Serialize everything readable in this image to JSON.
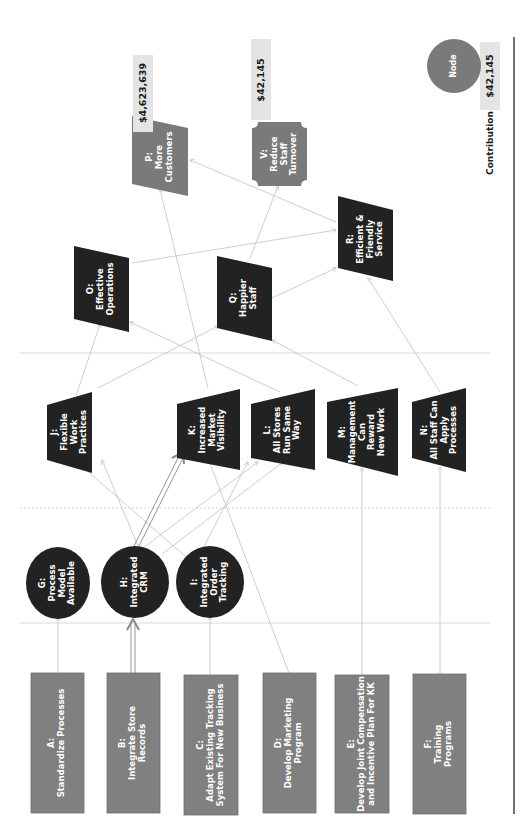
{
  "diagram": {
    "orientation": "rotated-90-ccw",
    "colors": {
      "input_box": "#808080",
      "intermediate": "#222222",
      "outcome": "#7a7a7a",
      "value_tag": "#e4e4e4",
      "connector": "#c8c8c8",
      "highlight_connector": "#8a8a8a",
      "legend_node": "#7a7a7a",
      "frame_line": "#222222"
    },
    "inputs": [
      {
        "id": "A",
        "label": "A:\nStandardize Processes"
      },
      {
        "id": "B",
        "label": "B:\nIntegrate Store\nRecords"
      },
      {
        "id": "C",
        "label": "C:\nAdapt Existing Tracking\nSystem For New Business"
      },
      {
        "id": "D",
        "label": "D:\nDevelop Marketing\nProgram"
      },
      {
        "id": "E",
        "label": "E:\nDevelop Joint Compensation\nand Incentive Plan For KK"
      },
      {
        "id": "F",
        "label": "F:\nTraining Programs"
      }
    ],
    "capabilities": [
      {
        "id": "G",
        "label": "G:\nProcess\nModel\nAvailable"
      },
      {
        "id": "H",
        "label": "H:\nIntegrated\nCRM"
      },
      {
        "id": "I",
        "label": "I:\nIntegrated\nOrder\nTracking"
      }
    ],
    "intermediate_outcomes": [
      {
        "id": "J",
        "label": "J:\nFlexible\nWork\nPractices"
      },
      {
        "id": "K",
        "label": "K:\nIncreased\nMarket\nVisibility"
      },
      {
        "id": "L",
        "label": "L:\nAll Stores\nRun Same\nWay"
      },
      {
        "id": "M",
        "label": "M:\nManagement\nCan\nReward\nNew Work"
      },
      {
        "id": "N",
        "label": "N:\nAll Staff Can\nApply\nProcesses"
      }
    ],
    "business_outcomes": [
      {
        "id": "O",
        "label": "O:\nEffective\nOperations"
      },
      {
        "id": "Q",
        "label": "Q:\nHappier\nStaff"
      },
      {
        "id": "R",
        "label": "R:\nEfficient &\nFriendly\nService"
      }
    ],
    "end_benefits": [
      {
        "id": "P",
        "label": "P:\nMore\nCustomers",
        "contribution": "$4,623,639"
      },
      {
        "id": "V",
        "label": "V:\nReduce\nStaff\nTurnover",
        "contribution": "$42,145"
      }
    ],
    "edges": [
      {
        "from": "A",
        "to": "G"
      },
      {
        "from": "B",
        "to": "H",
        "highlight": true
      },
      {
        "from": "C",
        "to": "I"
      },
      {
        "from": "D",
        "to": "K"
      },
      {
        "from": "E",
        "to": "M"
      },
      {
        "from": "F",
        "to": "N"
      },
      {
        "from": "G",
        "to": "L"
      },
      {
        "from": "H",
        "to": "K",
        "highlight": true
      },
      {
        "from": "H",
        "to": "J"
      },
      {
        "from": "H",
        "to": "L"
      },
      {
        "from": "I",
        "to": "J"
      },
      {
        "from": "I",
        "to": "L"
      },
      {
        "from": "J",
        "to": "O"
      },
      {
        "from": "J",
        "to": "Q"
      },
      {
        "from": "K",
        "to": "P"
      },
      {
        "from": "L",
        "to": "O"
      },
      {
        "from": "M",
        "to": "Q"
      },
      {
        "from": "N",
        "to": "R"
      },
      {
        "from": "O",
        "to": "R"
      },
      {
        "from": "Q",
        "to": "R"
      },
      {
        "from": "Q",
        "to": "V"
      },
      {
        "from": "R",
        "to": "P"
      }
    ]
  },
  "legend": {
    "node_label": "Node",
    "contribution_label": "Contribution",
    "contribution_value": "$42,145"
  }
}
